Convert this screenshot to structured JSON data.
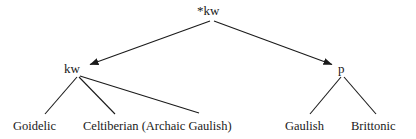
{
  "diagram": {
    "type": "language-family-tree",
    "nodes": {
      "root": {
        "label": "*kw"
      },
      "mid_left": {
        "label": "kw"
      },
      "mid_right": {
        "label": "p"
      },
      "leaf_1": {
        "label": "Goidelic"
      },
      "leaf_2": {
        "label": "Celtiberian (Archaic Gaulish)"
      },
      "leaf_3": {
        "label": "Gaulish"
      },
      "leaf_4": {
        "label": "Brittonic"
      }
    },
    "edges": [
      {
        "from": "root",
        "to": "mid_left",
        "arrow": true
      },
      {
        "from": "root",
        "to": "mid_right",
        "arrow": true
      },
      {
        "from": "mid_left",
        "to": "leaf_1",
        "arrow": false
      },
      {
        "from": "mid_left",
        "to": "leaf_2",
        "arrow": false
      },
      {
        "from": "mid_left",
        "to": "leaf_2_gaulish_part",
        "arrow": false
      },
      {
        "from": "mid_right",
        "to": "leaf_3",
        "arrow": false
      },
      {
        "from": "mid_right",
        "to": "leaf_4",
        "arrow": false
      }
    ],
    "colors": {
      "background": "#ffffff",
      "text": "#1a1a1a",
      "line": "#1a1a1a"
    }
  }
}
